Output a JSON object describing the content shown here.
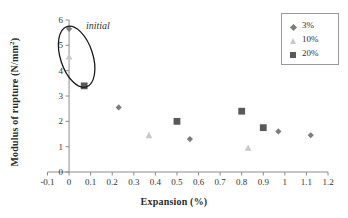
{
  "chart_data": {
    "type": "scatter",
    "title": "",
    "xlabel": "Expansion (%)",
    "ylabel": "Modulus of rupture (N/mm2)",
    "ylabel_display": "Modulus of rupture (N/mm",
    "ylabel_superscript": "2",
    "ylabel_tail": ")",
    "xlim": [
      -0.1,
      1.2
    ],
    "ylim": [
      0,
      6
    ],
    "xticks": [
      "-0.1",
      "0",
      "0.1",
      "0.2",
      "0.3",
      "0.4",
      "0.5",
      "0.6",
      "0.7",
      "0.8",
      "0.9",
      "1",
      "1.1",
      "1.2"
    ],
    "xtick_values": [
      -0.1,
      0,
      0.1,
      0.2,
      0.3,
      0.4,
      0.5,
      0.6,
      0.7,
      0.8,
      0.9,
      1.0,
      1.1,
      1.2
    ],
    "yticks": [
      "0",
      "1",
      "2",
      "3",
      "4",
      "5",
      "6"
    ],
    "ytick_values": [
      0,
      1,
      2,
      3,
      4,
      5,
      6
    ],
    "grid": false,
    "legend_position": "top-right",
    "series": [
      {
        "name": "3%",
        "marker": "diamond",
        "color": "#7d7d7d",
        "points": [
          {
            "x": 0.0,
            "y": 5.65
          },
          {
            "x": 0.23,
            "y": 2.55
          },
          {
            "x": 0.56,
            "y": 1.3
          },
          {
            "x": 0.97,
            "y": 1.6
          },
          {
            "x": 1.12,
            "y": 1.45
          }
        ]
      },
      {
        "name": "10%",
        "marker": "triangle",
        "color": "#c9c9c9",
        "points": [
          {
            "x": 0.0,
            "y": 4.55
          },
          {
            "x": 0.37,
            "y": 1.45
          },
          {
            "x": 0.83,
            "y": 0.95
          }
        ]
      },
      {
        "name": "20%",
        "marker": "square",
        "color": "#595959",
        "points": [
          {
            "x": 0.07,
            "y": 3.4
          },
          {
            "x": 0.5,
            "y": 2.0
          },
          {
            "x": 0.8,
            "y": 2.4
          },
          {
            "x": 0.9,
            "y": 1.75
          }
        ]
      }
    ],
    "annotations": [
      {
        "type": "text",
        "text": "initial",
        "style": "italic",
        "x": 0.17,
        "y": 5.55
      },
      {
        "type": "ellipse",
        "label": "initial-group-ellipse",
        "center_x": 0.035,
        "center_y": 4.55,
        "radius_x": 0.075,
        "radius_y": 1.25,
        "rotation_deg": -18,
        "stroke": "#1a1a1a"
      }
    ]
  },
  "legend": {
    "items": [
      {
        "label": "3%",
        "marker": "diamond"
      },
      {
        "label": "10%",
        "marker": "triangle"
      },
      {
        "label": "20%",
        "marker": "square"
      }
    ]
  },
  "colors": {
    "axis": "#8c8c8c",
    "text": "#2b2b2b",
    "series_3": "#7d7d7d",
    "series_10": "#c9c9c9",
    "series_20": "#595959",
    "ellipse": "#1a1a1a",
    "legend_border": "#9a9a9a"
  }
}
